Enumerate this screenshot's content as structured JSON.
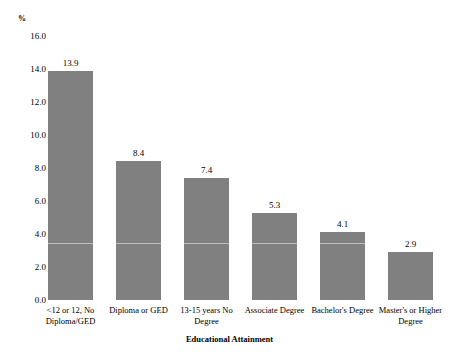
{
  "chart_data": {
    "type": "bar",
    "title": "",
    "xlabel": "Educational Attainment",
    "ylabel": "%",
    "categories": [
      "<12 or 12, No Diploma/GED",
      "Diploma or GED",
      "13-15 years No Degree",
      "Associate Degree",
      "Bachelor's Degree",
      "Master's or Higher Degree"
    ],
    "values": [
      13.9,
      8.4,
      7.4,
      5.3,
      4.1,
      2.9
    ],
    "value_labels": [
      "13.9",
      "8.4",
      "7.4",
      "5.3",
      "4.1",
      "2.9"
    ],
    "ylim": [
      0.0,
      16.0
    ],
    "yticks": [
      0.0,
      2.0,
      4.0,
      6.0,
      8.0,
      10.0,
      12.0,
      14.0,
      16.0
    ],
    "ytick_labels": [
      "0.0",
      "2.0",
      "4.0",
      "6.0",
      "8.0",
      "10.0",
      "12.0",
      "14.0",
      "16.0"
    ],
    "grid": false,
    "legend": null,
    "bar_color": "#808080",
    "gridline_value": 3.45
  }
}
